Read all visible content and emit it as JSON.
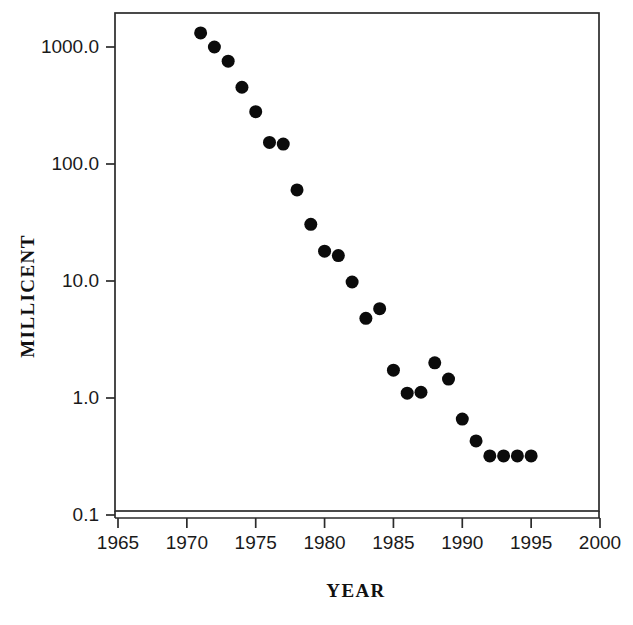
{
  "chart_data": {
    "type": "scatter",
    "title": "",
    "xlabel": "YEAR",
    "ylabel": "MILLICENT",
    "xlim": [
      1965,
      2000
    ],
    "ylim": [
      0.1,
      2000
    ],
    "yscale": "log",
    "xscale": "linear",
    "grid": false,
    "legend": null,
    "xticks": [
      1965,
      1970,
      1975,
      1980,
      1985,
      1990,
      1995,
      2000
    ],
    "xtick_labels": [
      "1965",
      "1970",
      "1975",
      "1980",
      "1985",
      "1990",
      "1995",
      "2000"
    ],
    "yticks": [
      1000.0,
      100.0,
      10.0,
      1.0,
      0.1
    ],
    "ytick_labels": [
      "1000.0",
      "100.0",
      "10.0",
      "1.0",
      "0.1"
    ],
    "marker": "filled-circle",
    "marker_color": "#0b0b0b",
    "marker_size_px": 13,
    "x": [
      1971,
      1972,
      1973,
      1974,
      1975,
      1976,
      1977,
      1978,
      1979,
      1980,
      1981,
      1982,
      1983,
      1984,
      1985,
      1986,
      1987,
      1988,
      1989,
      1990,
      1991,
      1992,
      1993,
      1994,
      1995
    ],
    "y": [
      1320,
      1000,
      757,
      453,
      280,
      153,
      148,
      60,
      30.5,
      18,
      16.5,
      9.8,
      4.8,
      5.8,
      1.73,
      1.1,
      1.12,
      2.0,
      1.45,
      0.66,
      0.43,
      0.32,
      0.32,
      0.32,
      0.32
    ],
    "points": [
      {
        "x": 1971,
        "y": 1320
      },
      {
        "x": 1972,
        "y": 1000
      },
      {
        "x": 1973,
        "y": 757
      },
      {
        "x": 1974,
        "y": 453
      },
      {
        "x": 1975,
        "y": 280
      },
      {
        "x": 1976,
        "y": 153
      },
      {
        "x": 1977,
        "y": 148
      },
      {
        "x": 1978,
        "y": 60
      },
      {
        "x": 1979,
        "y": 30.5
      },
      {
        "x": 1980,
        "y": 18
      },
      {
        "x": 1981,
        "y": 16.5
      },
      {
        "x": 1982,
        "y": 9.8
      },
      {
        "x": 1983,
        "y": 4.8
      },
      {
        "x": 1984,
        "y": 5.8
      },
      {
        "x": 1985,
        "y": 1.73
      },
      {
        "x": 1986,
        "y": 1.1
      },
      {
        "x": 1987,
        "y": 1.12
      },
      {
        "x": 1988,
        "y": 2.0
      },
      {
        "x": 1989,
        "y": 1.45
      },
      {
        "x": 1990,
        "y": 0.66
      },
      {
        "x": 1991,
        "y": 0.43
      },
      {
        "x": 1992,
        "y": 0.32
      },
      {
        "x": 1993,
        "y": 0.32
      },
      {
        "x": 1994,
        "y": 0.32
      },
      {
        "x": 1995,
        "y": 0.32
      }
    ]
  },
  "colors": {
    "marker": "#0b0b0b",
    "axis": "#2b2b2b",
    "text": "#111111",
    "background": "#ffffff"
  }
}
